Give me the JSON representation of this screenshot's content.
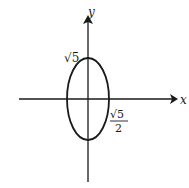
{
  "figure": {
    "type": "ellipse-on-axes",
    "axes": {
      "x_label": "x",
      "y_label": "y"
    },
    "ellipse": {
      "center": [
        0,
        0
      ],
      "semi_major_axis": "√5",
      "semi_minor_axis": "√5/2",
      "orientation": "vertical"
    },
    "labels": {
      "y_intercept": "√5",
      "x_intercept_num": "√5",
      "x_intercept_den": "2"
    },
    "colors": {
      "stroke": "#1a1a1a",
      "background": "#ffffff"
    }
  }
}
